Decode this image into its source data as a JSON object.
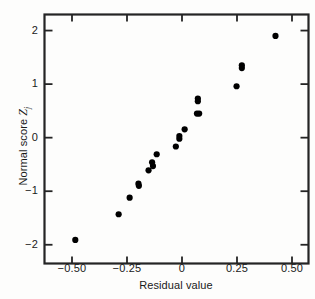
{
  "chart_data": {
    "type": "scatter",
    "title": "",
    "xlabel": "Residual value",
    "ylabel_text": "Normal score ",
    "ylabel_symbol": "Z",
    "ylabel_subscript": "j",
    "xlim": [
      -0.625,
      0.575
    ],
    "ylim": [
      -2.35,
      2.3
    ],
    "xticks": [
      -0.5,
      -0.25,
      0,
      0.25,
      0.5
    ],
    "xtick_labels": [
      "-0.50",
      "-0.25",
      "0",
      "0.25",
      "0.50"
    ],
    "yticks": [
      2,
      1,
      0,
      -1,
      -2
    ],
    "ytick_labels": [
      "2",
      "1",
      "0",
      "-1",
      "-2"
    ],
    "grid": false,
    "legend": "none",
    "marker": "filled-circle",
    "marker_color": "#000000",
    "frame_color": "#222222",
    "points": [
      {
        "x": -0.485,
        "y": -1.91
      },
      {
        "x": -0.288,
        "y": -1.43
      },
      {
        "x": -0.238,
        "y": -1.12
      },
      {
        "x": -0.198,
        "y": -0.86
      },
      {
        "x": -0.196,
        "y": -0.9
      },
      {
        "x": -0.152,
        "y": -0.61
      },
      {
        "x": -0.136,
        "y": -0.46
      },
      {
        "x": -0.132,
        "y": -0.53
      },
      {
        "x": -0.115,
        "y": -0.31
      },
      {
        "x": -0.028,
        "y": -0.165
      },
      {
        "x": -0.012,
        "y": -0.02
      },
      {
        "x": -0.012,
        "y": 0.03
      },
      {
        "x": 0.012,
        "y": 0.155
      },
      {
        "x": 0.068,
        "y": 0.45
      },
      {
        "x": 0.078,
        "y": 0.45
      },
      {
        "x": 0.072,
        "y": 0.68
      },
      {
        "x": 0.072,
        "y": 0.73
      },
      {
        "x": 0.248,
        "y": 0.96
      },
      {
        "x": 0.272,
        "y": 1.3
      },
      {
        "x": 0.272,
        "y": 1.35
      },
      {
        "x": 0.425,
        "y": 1.9
      }
    ]
  }
}
